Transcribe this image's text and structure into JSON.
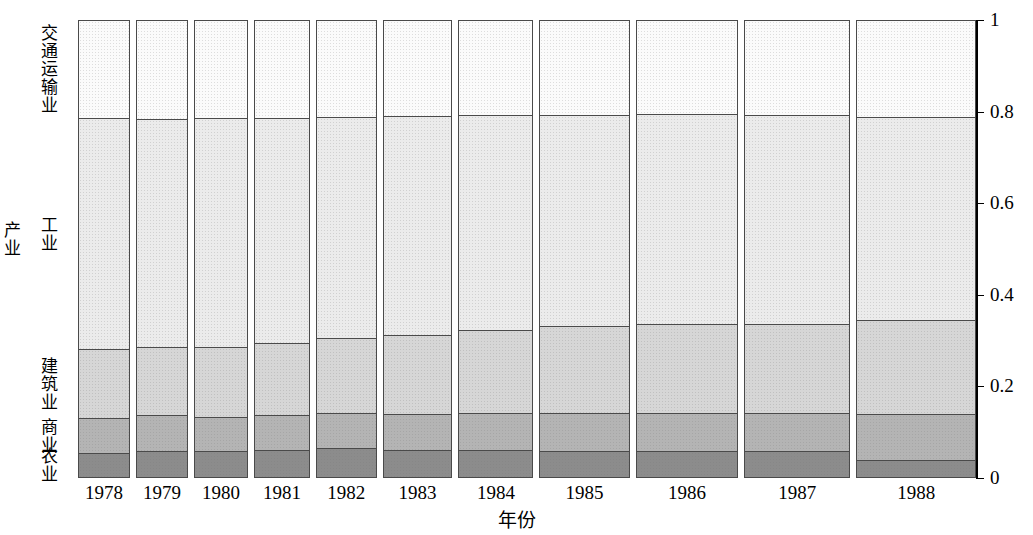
{
  "chart_data": {
    "type": "bar",
    "subtype": "mosaic-spine-plot-100pct-stacked",
    "title": "",
    "xlabel": "年份",
    "ylabel": "产业",
    "ylim": [
      0,
      1
    ],
    "yticks": [
      "0",
      "0.2",
      "0.4",
      "0.6",
      "0.8",
      "1"
    ],
    "ytick_values": [
      0,
      0.2,
      0.4,
      0.6,
      0.8,
      1
    ],
    "grid": false,
    "legend": "none",
    "categories": [
      "1978",
      "1979",
      "1980",
      "1981",
      "1982",
      "1983",
      "1984",
      "1985",
      "1986",
      "1987",
      "1988"
    ],
    "segment_order_bottom_to_top": [
      "农业",
      "商业",
      "建筑业",
      "工业",
      "交通运输业"
    ],
    "segment_labels": {
      "agriculture": "农业",
      "commerce": "商业",
      "construction": "建筑业",
      "industry": "工业",
      "transport": "交通运输业"
    },
    "segment_colors": {
      "agriculture": "#8c8c8c",
      "commerce": "#b4b4b4",
      "construction": "#d6d6d6",
      "industry": "#ebebeb",
      "transport": "#fbfbfb"
    },
    "column_widths_fraction": [
      0.062,
      0.061,
      0.065,
      0.066,
      0.072,
      0.083,
      0.089,
      0.107,
      0.122,
      0.126,
      0.142
    ],
    "series": [
      {
        "name": "农业",
        "values": [
          0.055,
          0.06,
          0.058,
          0.062,
          0.066,
          0.062,
          0.062,
          0.06,
          0.058,
          0.058,
          0.04
        ]
      },
      {
        "name": "商业",
        "values": [
          0.075,
          0.077,
          0.076,
          0.075,
          0.076,
          0.078,
          0.081,
          0.082,
          0.083,
          0.085,
          0.1
        ]
      },
      {
        "name": "建筑业",
        "values": [
          0.152,
          0.148,
          0.152,
          0.157,
          0.163,
          0.172,
          0.181,
          0.19,
          0.195,
          0.193,
          0.205
        ]
      },
      {
        "name": "工业",
        "values": [
          0.503,
          0.498,
          0.5,
          0.493,
          0.484,
          0.478,
          0.469,
          0.461,
          0.458,
          0.457,
          0.443
        ]
      },
      {
        "name": "交通运输业",
        "values": [
          0.215,
          0.217,
          0.214,
          0.213,
          0.211,
          0.21,
          0.207,
          0.207,
          0.206,
          0.207,
          0.212
        ]
      }
    ],
    "cumulative_boundaries_bottom_to_top": {
      "1978": [
        0.055,
        0.13,
        0.282,
        0.785,
        1.0
      ],
      "1979": [
        0.06,
        0.137,
        0.285,
        0.783,
        1.0
      ],
      "1980": [
        0.058,
        0.134,
        0.286,
        0.786,
        1.0
      ],
      "1981": [
        0.062,
        0.137,
        0.294,
        0.787,
        1.0
      ],
      "1982": [
        0.066,
        0.142,
        0.305,
        0.789,
        1.0
      ],
      "1983": [
        0.062,
        0.14,
        0.312,
        0.79,
        1.0
      ],
      "1984": [
        0.062,
        0.143,
        0.324,
        0.793,
        1.0
      ],
      "1985": [
        0.06,
        0.142,
        0.332,
        0.793,
        1.0
      ],
      "1986": [
        0.058,
        0.141,
        0.336,
        0.794,
        1.0
      ],
      "1987": [
        0.058,
        0.143,
        0.336,
        0.793,
        1.0
      ],
      "1988": [
        0.04,
        0.14,
        0.345,
        0.788,
        1.0
      ]
    }
  },
  "axis": {
    "y_title": "产业",
    "x_title": "年份"
  }
}
